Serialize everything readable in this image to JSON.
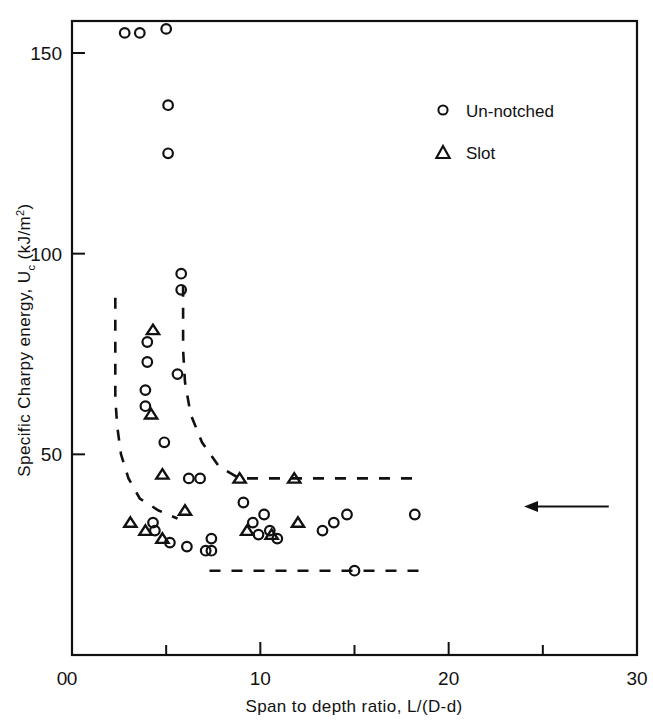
{
  "chart_data": {
    "type": "scatter",
    "title": "",
    "xlabel": "Span to depth ratio, L/(D-d)",
    "ylabel_full": "Specific Charpy energy, U_c (kJ/m^2)",
    "ylabel_prefix": "Specific Charpy energy,  U",
    "ylabel_sub": "c",
    "ylabel_unit_open": " (kJ/m",
    "ylabel_sup": "2",
    "ylabel_unit_close": ")",
    "xlim": [
      0,
      30
    ],
    "ylim": [
      0,
      160
    ],
    "xticks": [
      0,
      10,
      20,
      30
    ],
    "xtick_labels": [
      "0",
      "10",
      "20",
      "30"
    ],
    "xminor_ticks": [
      5,
      15,
      25
    ],
    "yticks": [
      0,
      50,
      100,
      150
    ],
    "ytick_labels": [
      "0",
      "50",
      "100",
      "150"
    ],
    "grid": false,
    "legend_position": "upper-right-inside",
    "series": [
      {
        "name": "Un-notched",
        "marker": "circle",
        "points": [
          [
            2.8,
            155
          ],
          [
            3.6,
            155
          ],
          [
            5.0,
            156
          ],
          [
            5.1,
            137
          ],
          [
            5.1,
            125
          ],
          [
            5.8,
            95
          ],
          [
            5.8,
            91
          ],
          [
            4.0,
            78
          ],
          [
            4.0,
            73
          ],
          [
            3.9,
            66
          ],
          [
            3.9,
            62
          ],
          [
            5.6,
            70
          ],
          [
            4.9,
            53
          ],
          [
            6.2,
            44
          ],
          [
            6.8,
            44
          ],
          [
            9.1,
            38
          ],
          [
            4.3,
            33
          ],
          [
            4.4,
            31
          ],
          [
            5.2,
            28
          ],
          [
            6.1,
            27
          ],
          [
            7.1,
            26
          ],
          [
            7.4,
            26
          ],
          [
            7.4,
            29
          ],
          [
            9.6,
            33
          ],
          [
            9.9,
            30
          ],
          [
            10.2,
            35
          ],
          [
            10.5,
            31
          ],
          [
            10.9,
            29
          ],
          [
            13.3,
            31
          ],
          [
            13.9,
            33
          ],
          [
            14.6,
            35
          ],
          [
            18.2,
            35
          ],
          [
            15.0,
            21
          ]
        ]
      },
      {
        "name": "Slot",
        "marker": "triangle",
        "points": [
          [
            4.3,
            81
          ],
          [
            4.2,
            60
          ],
          [
            4.8,
            45
          ],
          [
            3.1,
            33
          ],
          [
            3.9,
            31
          ],
          [
            4.8,
            29
          ],
          [
            6.0,
            36
          ],
          [
            8.9,
            44
          ],
          [
            11.8,
            44
          ],
          [
            9.3,
            31
          ],
          [
            10.6,
            30
          ],
          [
            12.0,
            33
          ]
        ]
      }
    ],
    "envelopes": [
      {
        "name": "upper-bound-dashed",
        "points": [
          [
            2.3,
            89
          ],
          [
            2.3,
            80
          ],
          [
            2.3,
            72
          ],
          [
            2.3,
            64
          ],
          [
            2.4,
            57
          ],
          [
            2.6,
            50
          ],
          [
            3.0,
            44
          ],
          [
            3.6,
            39
          ],
          [
            4.6,
            36
          ],
          [
            5.6,
            34
          ]
        ]
      },
      {
        "name": "inner-dashed",
        "points": [
          [
            5.9,
            92
          ],
          [
            5.9,
            84
          ],
          [
            5.9,
            76
          ],
          [
            6.0,
            68
          ],
          [
            6.3,
            60
          ],
          [
            6.9,
            53
          ],
          [
            7.8,
            47
          ],
          [
            8.9,
            44
          ],
          [
            11.8,
            44
          ],
          [
            18.4,
            44
          ]
        ]
      },
      {
        "name": "lower-bound-dashed",
        "points": [
          [
            7.3,
            21
          ],
          [
            9.0,
            21
          ],
          [
            11.0,
            21
          ],
          [
            13.0,
            21
          ],
          [
            15.0,
            21
          ],
          [
            17.0,
            21
          ],
          [
            18.4,
            21
          ]
        ]
      }
    ],
    "annotations": [
      {
        "name": "left-arrow",
        "type": "arrow",
        "direction": "left",
        "x_start": 28.5,
        "x_end": 24.0,
        "y": 37
      }
    ],
    "legend": [
      {
        "marker": "circle",
        "label": "Un-notched"
      },
      {
        "marker": "triangle",
        "label": "Slot"
      }
    ]
  },
  "colors": {
    "ink": "#111111",
    "background": "#ffffff"
  }
}
